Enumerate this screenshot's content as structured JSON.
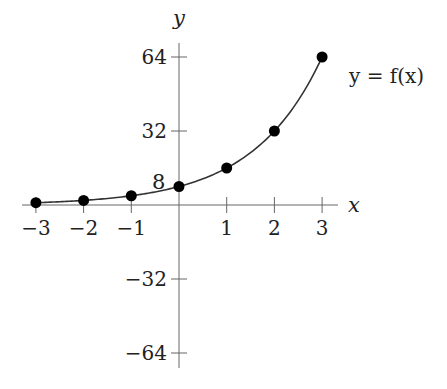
{
  "chart_data": {
    "type": "line",
    "title": "",
    "xlabel": "x",
    "ylabel": "y",
    "curve_label": "y = f(x)",
    "x": [
      -3,
      -2,
      -1,
      0,
      1,
      2,
      3
    ],
    "series": [
      {
        "name": "y = f(x)",
        "values": [
          1,
          2,
          4,
          8,
          16,
          32,
          64
        ]
      }
    ],
    "x_ticks": [
      -3,
      -2,
      -1,
      1,
      2,
      3
    ],
    "x_tick_labels": [
      "−3",
      "−2",
      "−1",
      "1",
      "2",
      "3"
    ],
    "y_ticks": [
      64,
      32,
      -32,
      -64
    ],
    "y_tick_labels": [
      "64",
      "32",
      "−32",
      "−64"
    ],
    "annotations": [
      {
        "text": "8",
        "x": 0,
        "y": 8
      }
    ],
    "xlim": [
      -3.3,
      3.3
    ],
    "ylim": [
      -70,
      70
    ],
    "grid": false,
    "legend": "none",
    "markers": "filled-circle",
    "colors": {
      "curve": "#333333",
      "points": "#000000",
      "axes": "#555555"
    }
  }
}
